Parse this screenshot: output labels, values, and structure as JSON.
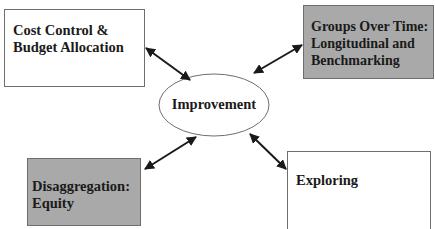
{
  "diagram": {
    "center": {
      "label": "Improvement"
    },
    "nodes": [
      {
        "id": "cost-control",
        "label": "Cost Control &\nBudget Allocation",
        "fill": "#ffffff"
      },
      {
        "id": "groups-over-time",
        "label": "Groups Over Time:\nLongitudinal and\nBenchmarking",
        "fill": "#a9a9a9"
      },
      {
        "id": "disaggregation",
        "label": "Disaggregation:\nEquity",
        "fill": "#a9a9a9"
      },
      {
        "id": "exploring",
        "label": "Exploring",
        "fill": "#ffffff"
      }
    ],
    "edges": [
      {
        "from": "improvement",
        "to": "cost-control",
        "type": "bidirectional"
      },
      {
        "from": "improvement",
        "to": "groups-over-time",
        "type": "bidirectional"
      },
      {
        "from": "improvement",
        "to": "disaggregation",
        "type": "bidirectional"
      },
      {
        "from": "improvement",
        "to": "exploring",
        "type": "bidirectional"
      }
    ]
  }
}
